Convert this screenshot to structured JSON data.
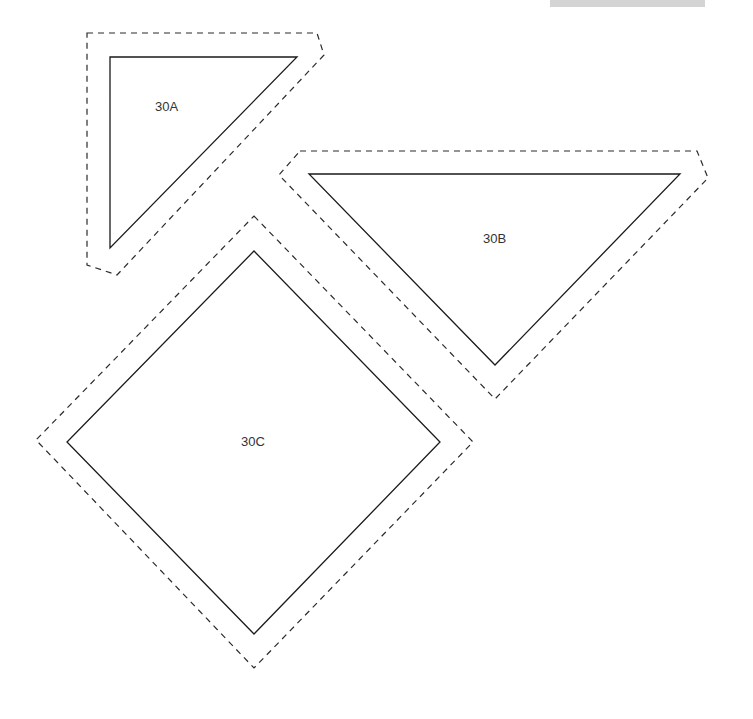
{
  "figure": {
    "pieces": [
      {
        "id": "30A",
        "label": "30A",
        "shape": "right-triangle",
        "outline": "solid",
        "seam_allowance": "dashed"
      },
      {
        "id": "30B",
        "label": "30B",
        "shape": "triangle",
        "outline": "solid",
        "seam_allowance": "dashed"
      },
      {
        "id": "30C",
        "label": "30C",
        "shape": "square-diamond",
        "outline": "solid",
        "seam_allowance": "dashed"
      }
    ]
  },
  "colors": {
    "line": "#1a1a1a",
    "header_bar": "#d4d4d4",
    "background": "#ffffff"
  }
}
